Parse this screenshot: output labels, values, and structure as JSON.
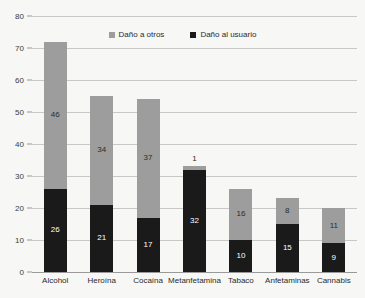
{
  "chart_data": {
    "type": "bar",
    "subtype": "stacked-vertical-bar",
    "title": "",
    "xlabel": "",
    "ylabel": "",
    "ylim": [
      0,
      80
    ],
    "yticks": [
      0,
      10,
      20,
      30,
      40,
      50,
      60,
      70,
      80
    ],
    "grid": true,
    "legend_position": "top-center",
    "categories": [
      "Alcohol",
      "Heroína",
      "Cocaína",
      "Metanfetamina",
      "Tabaco",
      "Anfetaminas",
      "Cannabis"
    ],
    "series": [
      {
        "name": "Daño al usuario",
        "color": "#1a1a1a",
        "values": [
          26,
          21,
          17,
          32,
          10,
          15,
          9
        ]
      },
      {
        "name": "Daño a otros",
        "color": "#9d9d9d",
        "values": [
          46,
          34,
          37,
          1,
          16,
          8,
          11
        ]
      }
    ],
    "totals": [
      72,
      55,
      54,
      33,
      26,
      23,
      20
    ],
    "label_placement": [
      {
        "category": "Alcohol",
        "user": "inside",
        "other": "inside"
      },
      {
        "category": "Heroína",
        "user": "inside",
        "other": "inside"
      },
      {
        "category": "Cocaína",
        "user": "inside",
        "other": "inside"
      },
      {
        "category": "Metanfetamina",
        "user": "inside",
        "other": "outside"
      },
      {
        "category": "Tabaco",
        "user": "inside",
        "other": "inside"
      },
      {
        "category": "Anfetaminas",
        "user": "inside",
        "other": "inside"
      },
      {
        "category": "Cannabis",
        "user": "inside",
        "other": "inside"
      }
    ]
  },
  "colors": {
    "background": "#f7f7f5",
    "gridline": "#c8c8c8",
    "axis": "#9a9a9a",
    "series_user": "#1a1a1a",
    "series_other": "#9d9d9d",
    "text": "#2b2b2b"
  }
}
